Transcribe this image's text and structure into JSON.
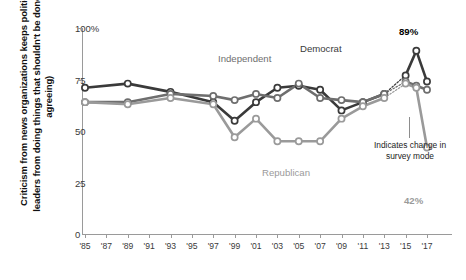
{
  "chart_data": {
    "type": "line",
    "title": "",
    "ylabel": "Criticism from news organizations keeps political leaders from doing things that shouldn't be done (% agreeing)",
    "xlabel": "",
    "ylim": [
      0,
      100
    ],
    "yticks": [
      "0",
      "25",
      "50",
      "75",
      "100%"
    ],
    "ytick_values": [
      0,
      25,
      50,
      75,
      100
    ],
    "xticks": [
      "'85",
      "'87",
      "'89",
      "'91",
      "'93",
      "'95",
      "'97",
      "'99",
      "'01",
      "'03",
      "'05",
      "'07",
      "'09",
      "'11",
      "'13",
      "'15",
      "'17"
    ],
    "xtick_values": [
      1985,
      1987,
      1989,
      1991,
      1993,
      1995,
      1997,
      1999,
      2001,
      2003,
      2005,
      2007,
      2009,
      2011,
      2013,
      2015,
      2017
    ],
    "grid": false,
    "legend_position": "inline-annotations",
    "series": [
      {
        "name": "Democrat",
        "color": "#3a3a3a",
        "x": [
          1985,
          1989,
          1993,
          1997,
          1999,
          2001,
          2003,
          2005,
          2007,
          2009,
          2011,
          2013,
          2015,
          2016,
          2017
        ],
        "values": [
          71,
          73,
          69,
          64,
          55,
          64,
          71,
          72,
          70,
          60,
          64,
          68,
          77,
          89,
          74
        ]
      },
      {
        "name": "Independent",
        "color": "#6e6e6e",
        "x": [
          1985,
          1989,
          1993,
          1997,
          1999,
          2001,
          2003,
          2005,
          2007,
          2009,
          2011,
          2013,
          2015,
          2016,
          2017
        ],
        "values": [
          64,
          64,
          68,
          67,
          65,
          68,
          66,
          73,
          66,
          65,
          64,
          68,
          74,
          72,
          70
        ]
      },
      {
        "name": "Republican",
        "color": "#9a9a9a",
        "x": [
          1985,
          1989,
          1993,
          1997,
          1999,
          2001,
          2003,
          2005,
          2007,
          2009,
          2011,
          2013,
          2015,
          2016,
          2017
        ],
        "values": [
          64,
          63,
          66,
          63,
          47,
          56,
          45,
          45,
          45,
          56,
          62,
          66,
          73,
          71,
          42
        ]
      }
    ],
    "series_labels": [
      {
        "name": "Independent",
        "color": "#6e6e6e"
      },
      {
        "name": "Democrat",
        "color": "#3a3a3a"
      },
      {
        "name": "Republican",
        "color": "#9a9a9a"
      }
    ],
    "end_labels": [
      {
        "text": "89%",
        "color": "#1b1b1b"
      },
      {
        "text": "42%",
        "color": "#9a9a9a"
      }
    ],
    "annotation": {
      "text": "Indicates change in survey mode",
      "dashed_segment_from": 2013,
      "dashed_segment_to": 2015
    }
  }
}
